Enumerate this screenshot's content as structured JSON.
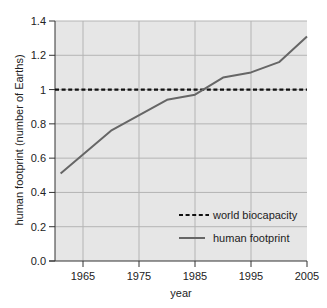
{
  "chart_data": {
    "type": "line",
    "title": "",
    "xlabel": "year",
    "ylabel": "human footprint (number of Earths)",
    "xlim": [
      1960,
      2005
    ],
    "ylim": [
      0.0,
      1.4
    ],
    "x_ticks": [
      1965,
      1975,
      1985,
      1995,
      2005
    ],
    "y_ticks": [
      0.0,
      0.2,
      0.4,
      0.6,
      0.8,
      1,
      1.2,
      1.4
    ],
    "y_tick_labels": [
      "0.0",
      "0.2",
      "0.4",
      "0.6",
      "0.8",
      "1",
      "1.2",
      "1.4"
    ],
    "grid": true,
    "legend_position": "lower right",
    "series": [
      {
        "name": "world biocapacity",
        "style": "dashed",
        "color": "#111111",
        "x": [
          1960,
          2005
        ],
        "values": [
          1.0,
          1.0
        ]
      },
      {
        "name": "human footprint",
        "style": "solid",
        "color": "#666666",
        "x": [
          1961,
          1970,
          1980,
          1985,
          1990,
          1995,
          2000,
          2005
        ],
        "values": [
          0.51,
          0.76,
          0.94,
          0.97,
          1.07,
          1.1,
          1.16,
          1.31
        ]
      }
    ]
  },
  "colors": {
    "plot_background": "#e6e6e6",
    "grid": "#b4b4b4",
    "axis": "#333333"
  }
}
